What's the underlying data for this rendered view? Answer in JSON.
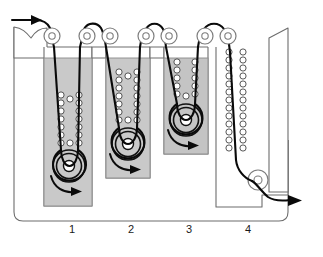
{
  "figure": {
    "kind": "process-schematic",
    "width": 323,
    "height": 257,
    "background_color": "#ffffff"
  },
  "colors": {
    "tank_liquid": "#c9c9c9",
    "tank_liquid_stage3": "#c4c4c4",
    "outline": "#6d6d6d",
    "web_strand": "#0a0a0a",
    "roller_outline": "#7d7d7d",
    "bubble_outline": "#3a3a3a",
    "label_text": "#1a1a1a"
  },
  "zones": [
    {
      "id": "zone-1",
      "label": "1",
      "label_x": 72,
      "label_y": 233,
      "has_tank": true
    },
    {
      "id": "zone-2",
      "label": "2",
      "label_x": 131,
      "label_y": 233,
      "has_tank": true
    },
    {
      "id": "zone-3",
      "label": "3",
      "label_x": 189,
      "label_y": 233,
      "has_tank": true
    },
    {
      "id": "zone-4",
      "label": "4",
      "label_x": 248,
      "label_y": 233,
      "has_tank": false
    }
  ],
  "tanks": [
    {
      "id": "tank-1",
      "zone": "1",
      "x": 44,
      "y": 58,
      "width": 48,
      "height": 148,
      "fill": "#c9c9c9"
    },
    {
      "id": "tank-2",
      "zone": "2",
      "x": 106,
      "y": 58,
      "width": 44,
      "height": 120,
      "fill": "#c9c9c9"
    },
    {
      "id": "tank-3",
      "zone": "3",
      "x": 164,
      "y": 58,
      "width": 44,
      "height": 96,
      "fill": "#c4c4c4"
    }
  ],
  "top_rollers": [
    {
      "id": "top-roller-1",
      "cx": 52,
      "cy": 36,
      "r_outer": 8,
      "r_inner": 3.2
    },
    {
      "id": "top-roller-2",
      "cx": 87,
      "cy": 36,
      "r_outer": 8,
      "r_inner": 3.2
    },
    {
      "id": "top-roller-3",
      "cx": 110,
      "cy": 36,
      "r_outer": 8,
      "r_inner": 3.2
    },
    {
      "id": "top-roller-4",
      "cx": 146,
      "cy": 36,
      "r_outer": 8,
      "r_inner": 3.2
    },
    {
      "id": "top-roller-5",
      "cx": 169,
      "cy": 36,
      "r_outer": 8,
      "r_inner": 3.2
    },
    {
      "id": "top-roller-6",
      "cx": 205,
      "cy": 36,
      "r_outer": 8,
      "r_inner": 3.2
    },
    {
      "id": "top-roller-7",
      "cx": 228,
      "cy": 36,
      "r_outer": 8,
      "r_inner": 3.2
    }
  ],
  "immersion_rollers": [
    {
      "id": "dip-roller-1",
      "zone": "1",
      "cx": 69,
      "cy": 166,
      "r": 16
    },
    {
      "id": "dip-roller-2",
      "zone": "2",
      "cx": 128,
      "cy": 144,
      "r": 16
    },
    {
      "id": "dip-roller-3",
      "zone": "3",
      "cx": 186,
      "cy": 120,
      "r": 16
    },
    {
      "id": "exit-roller-4",
      "zone": "4",
      "cx": 258,
      "cy": 180,
      "r": 10
    }
  ],
  "rotation_arrows": [
    {
      "id": "rotation-arrow-1",
      "zone": "1",
      "direction": "clockwise"
    },
    {
      "id": "rotation-arrow-2",
      "zone": "2",
      "direction": "clockwise"
    },
    {
      "id": "rotation-arrow-3",
      "zone": "3",
      "direction": "clockwise"
    }
  ],
  "flow": {
    "inlet_label": "web-inlet-arrow",
    "inlet_direction": "right",
    "outlet_label": "web-outlet-arrow",
    "outlet_direction": "right"
  },
  "bubble_columns": [
    {
      "id": "bubbles-1-left",
      "x": 61,
      "y_top": 95,
      "count": 7,
      "spacing": 8.4,
      "r": 3.1
    },
    {
      "id": "bubbles-1-right",
      "x": 78,
      "y_top": 95,
      "count": 7,
      "spacing": 8.4,
      "r": 3.1
    },
    {
      "id": "bubbles-2-left",
      "x": 120,
      "y_top": 72,
      "count": 8,
      "spacing": 8.4,
      "r": 3.1
    },
    {
      "id": "bubbles-2-right",
      "x": 137,
      "y_top": 72,
      "count": 8,
      "spacing": 8.4,
      "r": 3.1
    },
    {
      "id": "bubbles-3-left",
      "x": 178,
      "y_top": 62,
      "count": 6,
      "spacing": 8.4,
      "r": 3.1
    },
    {
      "id": "bubbles-3-right",
      "x": 195,
      "y_top": 62,
      "count": 6,
      "spacing": 8.4,
      "r": 3.1
    },
    {
      "id": "bubbles-4-left",
      "x": 228,
      "y_top": 52,
      "count": 13,
      "spacing": 8.4,
      "r": 3.1
    },
    {
      "id": "bubbles-4-right",
      "x": 243,
      "y_top": 52,
      "count": 13,
      "spacing": 8.4,
      "r": 3.1
    }
  ]
}
